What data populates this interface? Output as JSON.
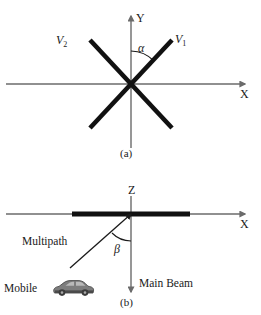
{
  "figure": {
    "panels": [
      {
        "id": "a",
        "caption": "(a)",
        "axes": {
          "vertical": "Y",
          "horizontal": "X"
        },
        "angle_label": "α",
        "vector_labels": {
          "left": "V",
          "left_sub": "2",
          "right": "V",
          "right_sub": "1"
        }
      },
      {
        "id": "b",
        "caption": "(b)",
        "axes": {
          "vertical": "Z",
          "horizontal": "X"
        },
        "angle_label": "β",
        "annotations": {
          "multipath": "Multipath",
          "main_beam": "Main Beam",
          "mobile": "Mobile"
        }
      }
    ]
  },
  "colors": {
    "background": "#ffffff",
    "axis": "#6b6b6b",
    "beam": "#111111",
    "text": "#1a1a1a",
    "car_body": "#7d7d7d",
    "car_dark": "#4a4a4a",
    "car_window": "#b9b9b9"
  }
}
